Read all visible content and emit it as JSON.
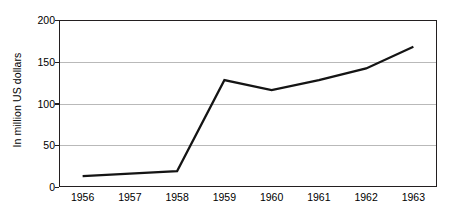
{
  "chart_data": {
    "type": "line",
    "title": "",
    "subtitle": "",
    "xlabel": "",
    "ylabel": "In million US dollars",
    "categories": [
      "1956",
      "1957",
      "1958",
      "1959",
      "1960",
      "1961",
      "1962",
      "1963"
    ],
    "series": [
      {
        "name": "In million US dollars",
        "values": [
          13,
          16,
          19,
          128,
          116,
          128,
          142,
          168
        ],
        "color": "#141414"
      }
    ],
    "ylim": [
      0,
      200
    ],
    "y_ticks": [
      0,
      50,
      100,
      150,
      200
    ],
    "y_tick_labels": [
      "0",
      "50",
      "100",
      "150",
      "200"
    ],
    "grid": {
      "horizontal": true,
      "vertical": false,
      "color": "#b9b9b9"
    },
    "legend": {
      "visible": false,
      "position": "none",
      "entries": []
    },
    "axis": {
      "left_visible": true,
      "bottom_visible": true,
      "top_visible": true,
      "right_visible": true,
      "color": "#231f20"
    },
    "markers": "none",
    "annotations": []
  }
}
